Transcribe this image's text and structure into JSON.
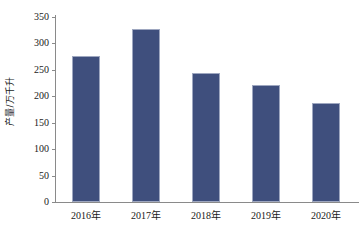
{
  "chart_data": {
    "type": "bar",
    "title": "",
    "xlabel": "",
    "ylabel": "产量/万千升",
    "categories": [
      "2016年",
      "2017年",
      "2018年",
      "2019年",
      "2020年"
    ],
    "values": [
      277,
      327,
      244,
      221,
      187
    ],
    "ylim": [
      0,
      350
    ],
    "yticks": [
      0,
      50,
      100,
      150,
      200,
      250,
      300,
      350
    ],
    "ytick_labels": [
      "0",
      "50",
      "100",
      "150",
      "200",
      "250",
      "300",
      "350"
    ],
    "grid": false,
    "legend": false,
    "legend_position": "none",
    "bar_color": "#3f4f7d",
    "bar_edge_color": "#9ea7c0",
    "axis_color": "#8a8a8a",
    "background_color": "#ffffff"
  }
}
